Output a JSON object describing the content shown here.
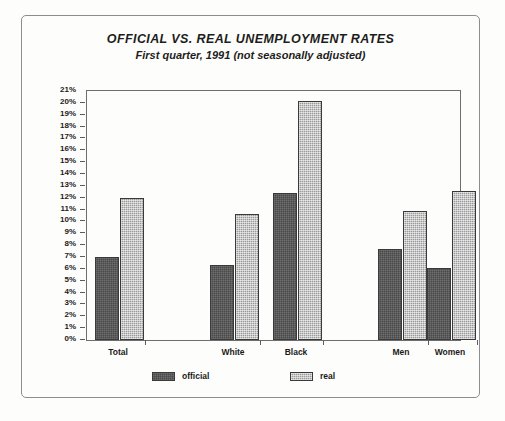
{
  "chart_data": {
    "type": "bar",
    "title": "OFFICIAL VS. REAL UNEMPLOYMENT RATES",
    "subtitle": "First quarter, 1991 (not seasonally adjusted)",
    "xlabel": "",
    "ylabel": "",
    "ylim": [
      0,
      21
    ],
    "ytick_step": 1,
    "ytick_suffix": "%",
    "grid": false,
    "legend_position": "bottom",
    "categories": [
      "Total",
      "White",
      "Black",
      "Men",
      "Women"
    ],
    "ytick_labels": [
      "21%",
      "20%",
      "19%",
      "18%",
      "17%",
      "16%",
      "15%",
      "14%",
      "13%",
      "12%",
      "11%",
      "10%",
      "9%",
      "8%",
      "7%",
      "6%",
      "5%",
      "4%",
      "3%",
      "2%",
      "1%",
      "0%"
    ],
    "series": [
      {
        "name": "official",
        "color": "#4a4a4a",
        "values": [
          7.0,
          6.3,
          12.4,
          7.7,
          6.1
        ]
      },
      {
        "name": "real",
        "color": "#9a9a9a",
        "values": [
          12.0,
          10.6,
          20.2,
          10.9,
          12.6
        ]
      }
    ]
  },
  "legend": {
    "items": [
      {
        "label": "official"
      },
      {
        "label": "real"
      }
    ]
  }
}
